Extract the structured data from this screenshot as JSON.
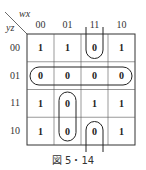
{
  "kmap": {
    "col_var": "wx",
    "row_var": "yz",
    "col_labels": [
      "00",
      "01",
      "11",
      "10"
    ],
    "row_labels": [
      "00",
      "01",
      "11",
      "10"
    ],
    "cells": [
      [
        "1",
        "1",
        "0",
        "1"
      ],
      [
        "0",
        "0",
        "0",
        "0"
      ],
      [
        "1",
        "0",
        "1",
        "1"
      ],
      [
        "1",
        "0",
        "0",
        "1"
      ]
    ],
    "groups": [
      {
        "name": "row-01-all-zeros",
        "cells": [
          [
            1,
            0
          ],
          [
            1,
            1
          ],
          [
            1,
            2
          ],
          [
            1,
            3
          ]
        ]
      },
      {
        "name": "col-01-rows-11-10",
        "cells": [
          [
            2,
            1
          ],
          [
            3,
            1
          ]
        ]
      },
      {
        "name": "col-11-wrap-rows-00-10",
        "cells": [
          [
            0,
            2
          ],
          [
            3,
            2
          ]
        ]
      }
    ]
  },
  "caption": "図 5・14"
}
